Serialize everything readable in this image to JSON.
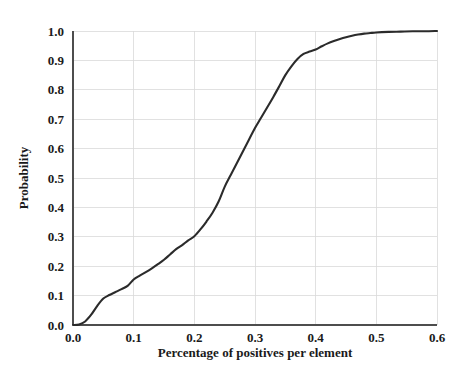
{
  "chart_data": {
    "type": "line",
    "title": "",
    "subtitle": "",
    "xlabel": "Percentage of positives per element",
    "ylabel": "Probability",
    "xlim": [
      0.0,
      0.6
    ],
    "ylim": [
      0.0,
      1.0
    ],
    "grid": true,
    "legend": "none",
    "xticks": [
      "0.0",
      "0.1",
      "0.2",
      "0.3",
      "0.4",
      "0.5",
      "0.6"
    ],
    "xtick_values": [
      0.0,
      0.1,
      0.2,
      0.3,
      0.4,
      0.5,
      0.6
    ],
    "yticks": [
      "0.0",
      "0.1",
      "0.2",
      "0.3",
      "0.4",
      "0.5",
      "0.6",
      "0.7",
      "0.8",
      "0.9",
      "1.0"
    ],
    "ytick_values": [
      0.0,
      0.1,
      0.2,
      0.3,
      0.4,
      0.5,
      0.6,
      0.7,
      0.8,
      0.9,
      1.0
    ],
    "line_color": "#2b2b2b",
    "series": [
      {
        "name": "Cumulative probability",
        "x": [
          0.0,
          0.01,
          0.02,
          0.03,
          0.04,
          0.05,
          0.06,
          0.07,
          0.08,
          0.09,
          0.1,
          0.11,
          0.12,
          0.13,
          0.14,
          0.15,
          0.16,
          0.17,
          0.18,
          0.19,
          0.2,
          0.21,
          0.22,
          0.23,
          0.24,
          0.25,
          0.26,
          0.27,
          0.28,
          0.29,
          0.3,
          0.31,
          0.32,
          0.33,
          0.34,
          0.35,
          0.36,
          0.37,
          0.38,
          0.39,
          0.4,
          0.41,
          0.42,
          0.43,
          0.44,
          0.45,
          0.46,
          0.47,
          0.48,
          0.49,
          0.5,
          0.52,
          0.54,
          0.56,
          0.58,
          0.6
        ],
        "values": [
          0.0,
          0.002,
          0.012,
          0.035,
          0.065,
          0.09,
          0.102,
          0.112,
          0.122,
          0.133,
          0.155,
          0.168,
          0.18,
          0.193,
          0.207,
          0.222,
          0.24,
          0.258,
          0.272,
          0.288,
          0.302,
          0.325,
          0.352,
          0.382,
          0.42,
          0.47,
          0.51,
          0.55,
          0.59,
          0.63,
          0.67,
          0.705,
          0.74,
          0.775,
          0.812,
          0.85,
          0.88,
          0.905,
          0.922,
          0.93,
          0.937,
          0.948,
          0.958,
          0.966,
          0.973,
          0.979,
          0.984,
          0.988,
          0.991,
          0.993,
          0.995,
          0.997,
          0.998,
          0.999,
          0.999,
          1.0
        ]
      }
    ]
  },
  "axes": {
    "x_title": "Percentage of positives per element",
    "y_title": "Probability"
  }
}
